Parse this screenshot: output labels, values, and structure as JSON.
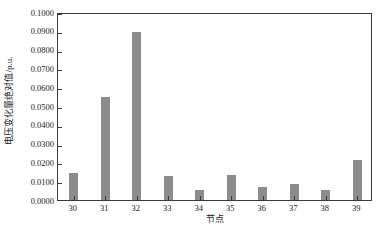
{
  "chart_data": {
    "type": "bar",
    "title": "",
    "subtitle": "",
    "xlabel": "节点",
    "ylabel": "电压变化量绝对值/p.u.",
    "categories": [
      "30",
      "31",
      "32",
      "33",
      "34",
      "35",
      "36",
      "37",
      "38",
      "39"
    ],
    "values": [
      0.0144,
      0.055,
      0.0896,
      0.0128,
      0.0055,
      0.0131,
      0.0072,
      0.0088,
      0.0054,
      0.0212
    ],
    "series": [
      {
        "name": "电压变化量绝对值",
        "values": [
          0.0144,
          0.055,
          0.0896,
          0.0128,
          0.0055,
          0.0131,
          0.0072,
          0.0088,
          0.0054,
          0.0212
        ]
      }
    ],
    "ylim": [
      0.0,
      0.1
    ],
    "xlim": [
      0,
      10
    ],
    "ytick_labels": [
      "0.0000",
      "0.0100",
      "0.0200",
      "0.0300",
      "0.0400",
      "0.0500",
      "0.0600",
      "0.0700",
      "0.0800",
      "0.0900",
      "0.1000"
    ],
    "ytick_values": [
      0.0,
      0.01,
      0.02,
      0.03,
      0.04,
      0.05,
      0.06,
      0.07,
      0.08,
      0.09,
      0.1
    ],
    "grid": false,
    "legend": false,
    "legend_position": "none",
    "bar_color": "#8c8c8c",
    "axis_color": "#3a3a3a",
    "background_color": "#ffffff"
  }
}
